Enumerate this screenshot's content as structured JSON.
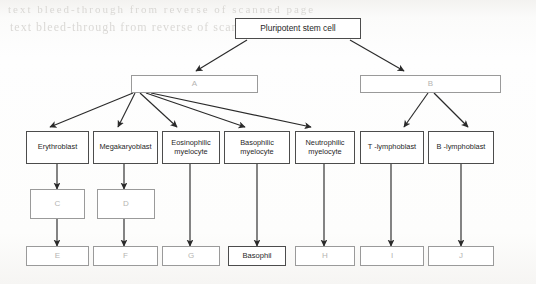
{
  "diagram": {
    "type": "flowchart",
    "background_artifacts": [
      "text bleed-through from reverse of scanned page",
      "text bleed-through from reverse of scanned page"
    ],
    "rows": {
      "row1": [
        {
          "id": "root",
          "label": "Pluripotent stem cell",
          "style": "dark"
        }
      ],
      "row2": [
        {
          "id": "A",
          "label": "A",
          "style": "faint"
        },
        {
          "id": "B",
          "label": "B",
          "style": "faint"
        }
      ],
      "row3": [
        {
          "id": "erythroblast",
          "label": "Erythroblast",
          "style": "dark"
        },
        {
          "id": "megakaryoblast",
          "label": "Megakaryoblast",
          "style": "dark"
        },
        {
          "id": "eosinophilic-myelocyte",
          "line1": "Eosinophilic",
          "line2": "myelocyte",
          "style": "dark"
        },
        {
          "id": "basophilic-myelocyte",
          "line1": "Basophilic",
          "line2": "myelocyte",
          "style": "dark"
        },
        {
          "id": "neutrophilic-myelocyte",
          "line1": "Neutrophilic",
          "line2": "myelocyte",
          "style": "dark"
        },
        {
          "id": "t-lymphoblast",
          "label": "T -lymphoblast",
          "style": "dark"
        },
        {
          "id": "b-lymphoblast",
          "label": "B -lymphoblast",
          "style": "dark"
        }
      ],
      "row4": [
        {
          "id": "C",
          "label": "C",
          "style": "faint"
        },
        {
          "id": "D",
          "label": "D",
          "style": "faint"
        }
      ],
      "row5": [
        {
          "id": "E",
          "label": "E",
          "style": "faint"
        },
        {
          "id": "F",
          "label": "F",
          "style": "faint"
        },
        {
          "id": "G",
          "label": "G",
          "style": "faint"
        },
        {
          "id": "basophil",
          "label": "Basophil",
          "style": "dark"
        },
        {
          "id": "H",
          "label": "H",
          "style": "faint"
        },
        {
          "id": "I",
          "label": "I",
          "style": "faint"
        },
        {
          "id": "J",
          "label": "J",
          "style": "faint"
        }
      ]
    },
    "colors": {
      "box_border_dark": "#4c4c4c",
      "box_border_light": "#8a8a8a",
      "text_dark": "#1f1f1f",
      "text_faint": "#b5b4b2",
      "arrow": "#2a2a2a",
      "page": "#fdfdfc"
    }
  }
}
